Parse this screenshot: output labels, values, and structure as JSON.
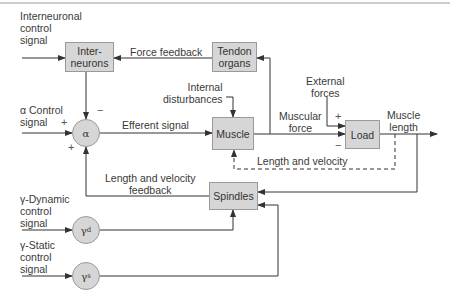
{
  "colors": {
    "block_fill": "#d6d6d6",
    "block_border": "#9a9a9a",
    "line": "#333333",
    "border_top": "#999999"
  },
  "blocks": {
    "interneurons": "Inter-\nneurons",
    "tendon_organs": "Tendon\norgans",
    "muscle": "Muscle",
    "load": "Load",
    "spindles": "Spindles"
  },
  "summing_nodes": {
    "alpha": "α",
    "gamma_d": {
      "symbol": "γ",
      "sub": "d"
    },
    "gamma_s": {
      "symbol": "γ",
      "sub": "s"
    }
  },
  "labels": {
    "interneuronal_control": "Interneuronal\ncontrol\nsignal",
    "force_feedback": "Force feedback",
    "alpha_control": "α Control\nsignal",
    "internal_disturbances": "Internal\ndisturbances",
    "external_forces": "External\nforces",
    "efferent_signal": "Efferent signal",
    "muscular_force": "Muscular\nforce",
    "muscle_length": "Muscle\nlength",
    "length_velocity": "Length and velocity",
    "length_velocity_feedback": "Length and velocity\nfeedback",
    "gamma_dynamic": "γ-Dynamic\ncontrol\nsignal",
    "gamma_static": "γ-Static\ncontrol\nsignal"
  },
  "signs": {
    "alpha_top": "−",
    "alpha_left": "+",
    "alpha_bottom": "+",
    "load_top": "+",
    "load_bottom": "−"
  }
}
